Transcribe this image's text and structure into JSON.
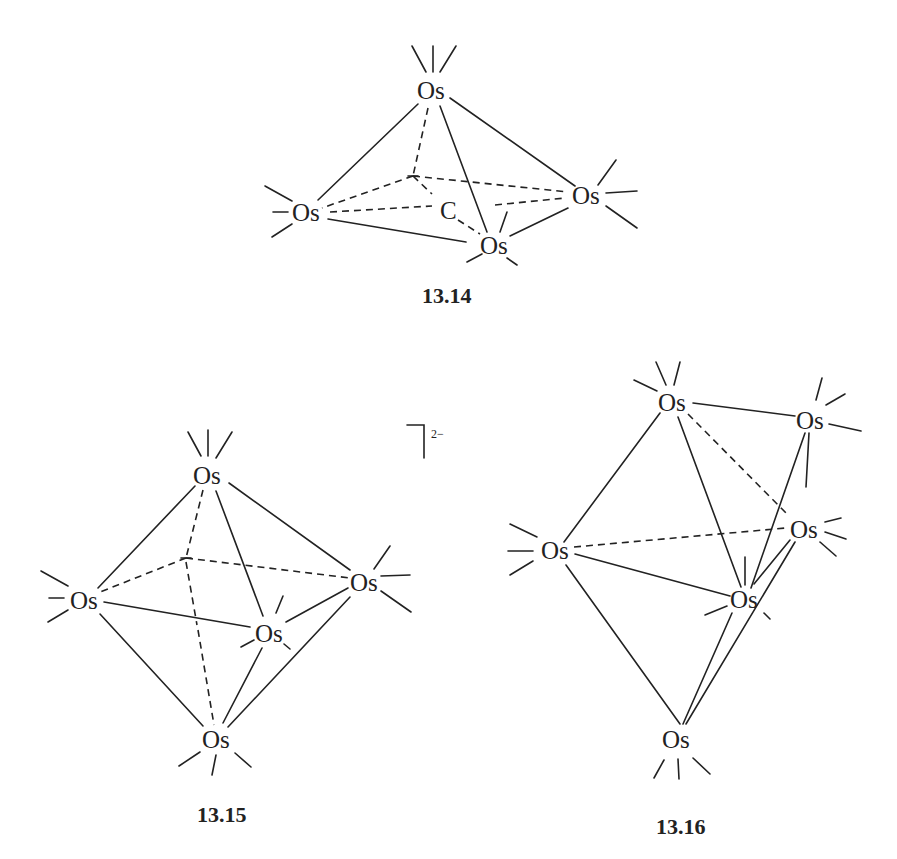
{
  "figure": {
    "structures": [
      {
        "id": "13.14",
        "label": "13.14",
        "atoms": [
          "Os",
          "Os",
          "Os",
          "Os",
          "C"
        ],
        "description": "Os4C cluster (square-based pyramid with one vertex missing / butterfly with carbide)"
      },
      {
        "id": "13.15",
        "label": "13.15",
        "atoms": [
          "Os",
          "Os",
          "Os",
          "Os",
          "Os",
          "Os"
        ],
        "charge": "2−",
        "description": "Octahedral Os6 dianion"
      },
      {
        "id": "13.16",
        "label": "13.16",
        "atoms": [
          "Os",
          "Os",
          "Os",
          "Os",
          "Os",
          "Os"
        ],
        "description": "Capped trigonal bipyramidal Os6 cluster"
      }
    ],
    "atom_symbol": "Os",
    "carbide_symbol": "C",
    "charge_label": "2−"
  }
}
